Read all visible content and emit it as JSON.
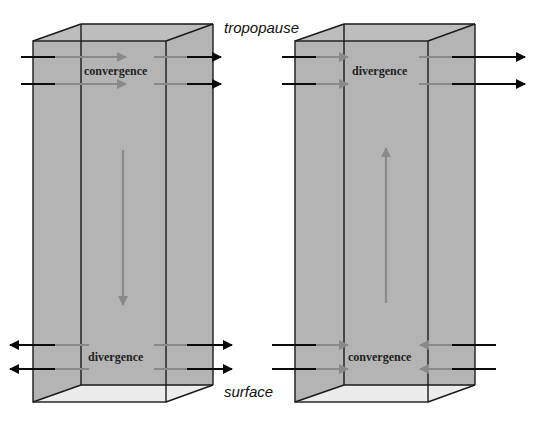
{
  "labels": {
    "top": "tropopause",
    "bottom": "surface"
  },
  "columns": [
    {
      "name": "low-pressure-column",
      "top_label": "convergence",
      "bottom_label": "divergence",
      "vertical_motion": "down"
    },
    {
      "name": "high-pressure-column",
      "top_label": "divergence",
      "bottom_label": "convergence",
      "vertical_motion": "up"
    }
  ],
  "colors": {
    "box_fill": "#b4b4b4",
    "box_floor": "#ececec",
    "outline": "#1a1a1a",
    "inner_arrow": "#8a8a8a",
    "outer_arrow": "#0a0a0a"
  }
}
